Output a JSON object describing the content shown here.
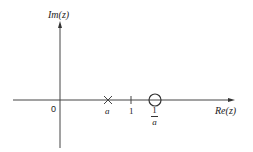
{
  "diagram": {
    "axes": {
      "vertical_label": "Im(z)",
      "horizontal_label": "Re(z)",
      "origin_label": "0"
    },
    "markers": [
      {
        "type": "pole",
        "symbol": "×",
        "label": "a",
        "position_re": "a"
      },
      {
        "type": "tick",
        "symbol": "|",
        "label": "1",
        "position_re": 1
      },
      {
        "type": "zero",
        "symbol": "○",
        "label_numerator": "1",
        "label_denominator": "a",
        "position_re": "1/a"
      }
    ],
    "colors": {
      "line": "#333333",
      "background": "#ffffff"
    }
  }
}
